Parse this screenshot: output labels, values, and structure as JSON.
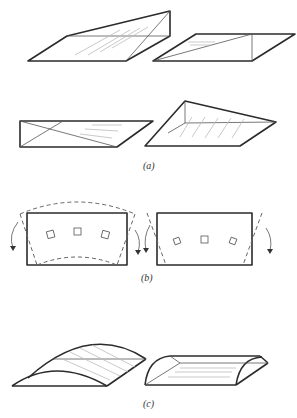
{
  "figure": {
    "panels": [
      {
        "label": "(a)",
        "description": "Four wedge / prism shapes shown in perspective"
      },
      {
        "label": "(b)",
        "description": "Two rectangles with dashed deformed outlines, squares inside and curved rotation arrows"
      },
      {
        "label": "(c)",
        "description": "Two curved shell / half-cylinder shapes"
      }
    ]
  }
}
